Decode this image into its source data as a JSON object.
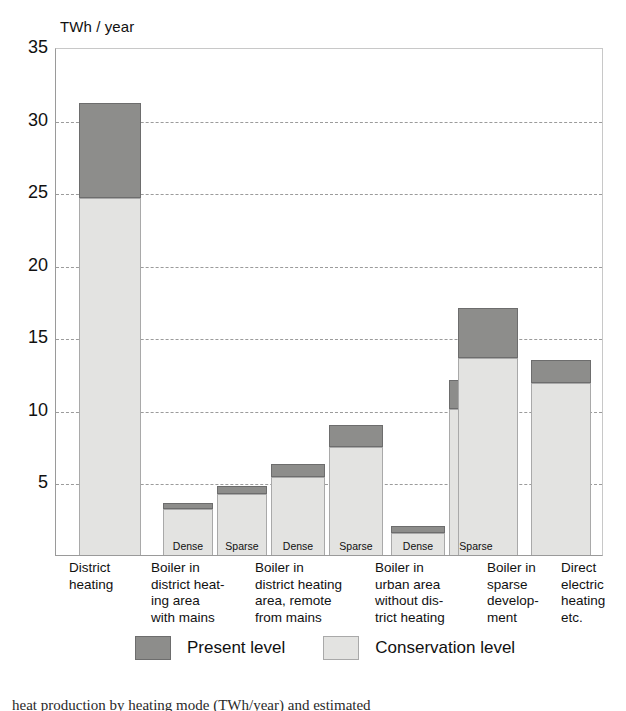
{
  "chart_data": {
    "type": "bar",
    "title": "",
    "subtitle": "",
    "ylabel": "TWh / year",
    "xlabel": "",
    "ylim": [
      0,
      35
    ],
    "yticks": [
      35,
      30,
      25,
      20,
      15,
      10,
      5
    ],
    "grid": true,
    "stacked": true,
    "legend_position": "bottom",
    "colors": {
      "present": "#8d8d8b",
      "conservation": "#e3e3e1"
    },
    "series": [
      {
        "name": "Conservation level",
        "values": [
          24.7,
          3.2,
          4.2,
          5.4,
          7.5,
          1.5,
          10.1,
          13.6,
          11.9
        ]
      },
      {
        "name": "Present level",
        "values": [
          6.6,
          0.4,
          0.6,
          0.9,
          1.5,
          0.5,
          2.0,
          3.5,
          1.6
        ]
      }
    ],
    "totals": [
      31.3,
      3.6,
      4.8,
      6.3,
      9.0,
      2.0,
      12.1,
      17.1,
      13.5
    ],
    "categories": [
      "District heating",
      "Boiler in district heating area with mains — Dense",
      "Boiler in district heating area with mains — Sparse",
      "Boiler in district heating area, remote from mains — Dense",
      "Boiler in district heating area, remote from mains — Sparse",
      "Boiler in urban area without district heating — Dense",
      "Boiler in urban area without district heating — Sparse",
      "Boiler in sparse development",
      "Direct electric heating etc."
    ]
  },
  "groups": [
    {
      "label": "District\nheating",
      "bars": [
        {
          "sublabel": "",
          "conservation": 24.7,
          "total": 31.3
        }
      ]
    },
    {
      "label": "Boiler in\ndistrict heat-\ning area\nwith mains",
      "bars": [
        {
          "sublabel": "Dense",
          "conservation": 3.2,
          "total": 3.6
        },
        {
          "sublabel": "Sparse",
          "conservation": 4.2,
          "total": 4.8
        }
      ]
    },
    {
      "label": "Boiler in\ndistrict heating\narea, remote\nfrom mains",
      "bars": [
        {
          "sublabel": "Dense",
          "conservation": 5.4,
          "total": 6.3
        },
        {
          "sublabel": "Sparse",
          "conservation": 7.5,
          "total": 9.0
        }
      ]
    },
    {
      "label": "Boiler in\nurban area\nwithout dis-\ntrict heating",
      "bars": [
        {
          "sublabel": "Dense",
          "conservation": 1.5,
          "total": 2.0
        },
        {
          "sublabel": "Sparse",
          "conservation": 10.1,
          "total": 12.1
        }
      ]
    },
    {
      "label": "Boiler in\nsparse\ndevelop-\nment",
      "bars": [
        {
          "sublabel": "",
          "conservation": 13.6,
          "total": 17.1
        }
      ]
    },
    {
      "label": "Direct\nelectric\nheating\netc.",
      "bars": [
        {
          "sublabel": "",
          "conservation": 11.9,
          "total": 13.5
        }
      ]
    }
  ],
  "axis": {
    "y_title": "TWh / year",
    "ticks": [
      "35",
      "30",
      "25",
      "20",
      "15",
      "10",
      "5"
    ]
  },
  "legend": {
    "items": [
      {
        "label": "Present level",
        "swatch": "present"
      },
      {
        "label": "Conservation level",
        "swatch": "conservation"
      }
    ]
  },
  "caption": {
    "text": "heat production by heating mode (TWh/year) and estimated"
  }
}
